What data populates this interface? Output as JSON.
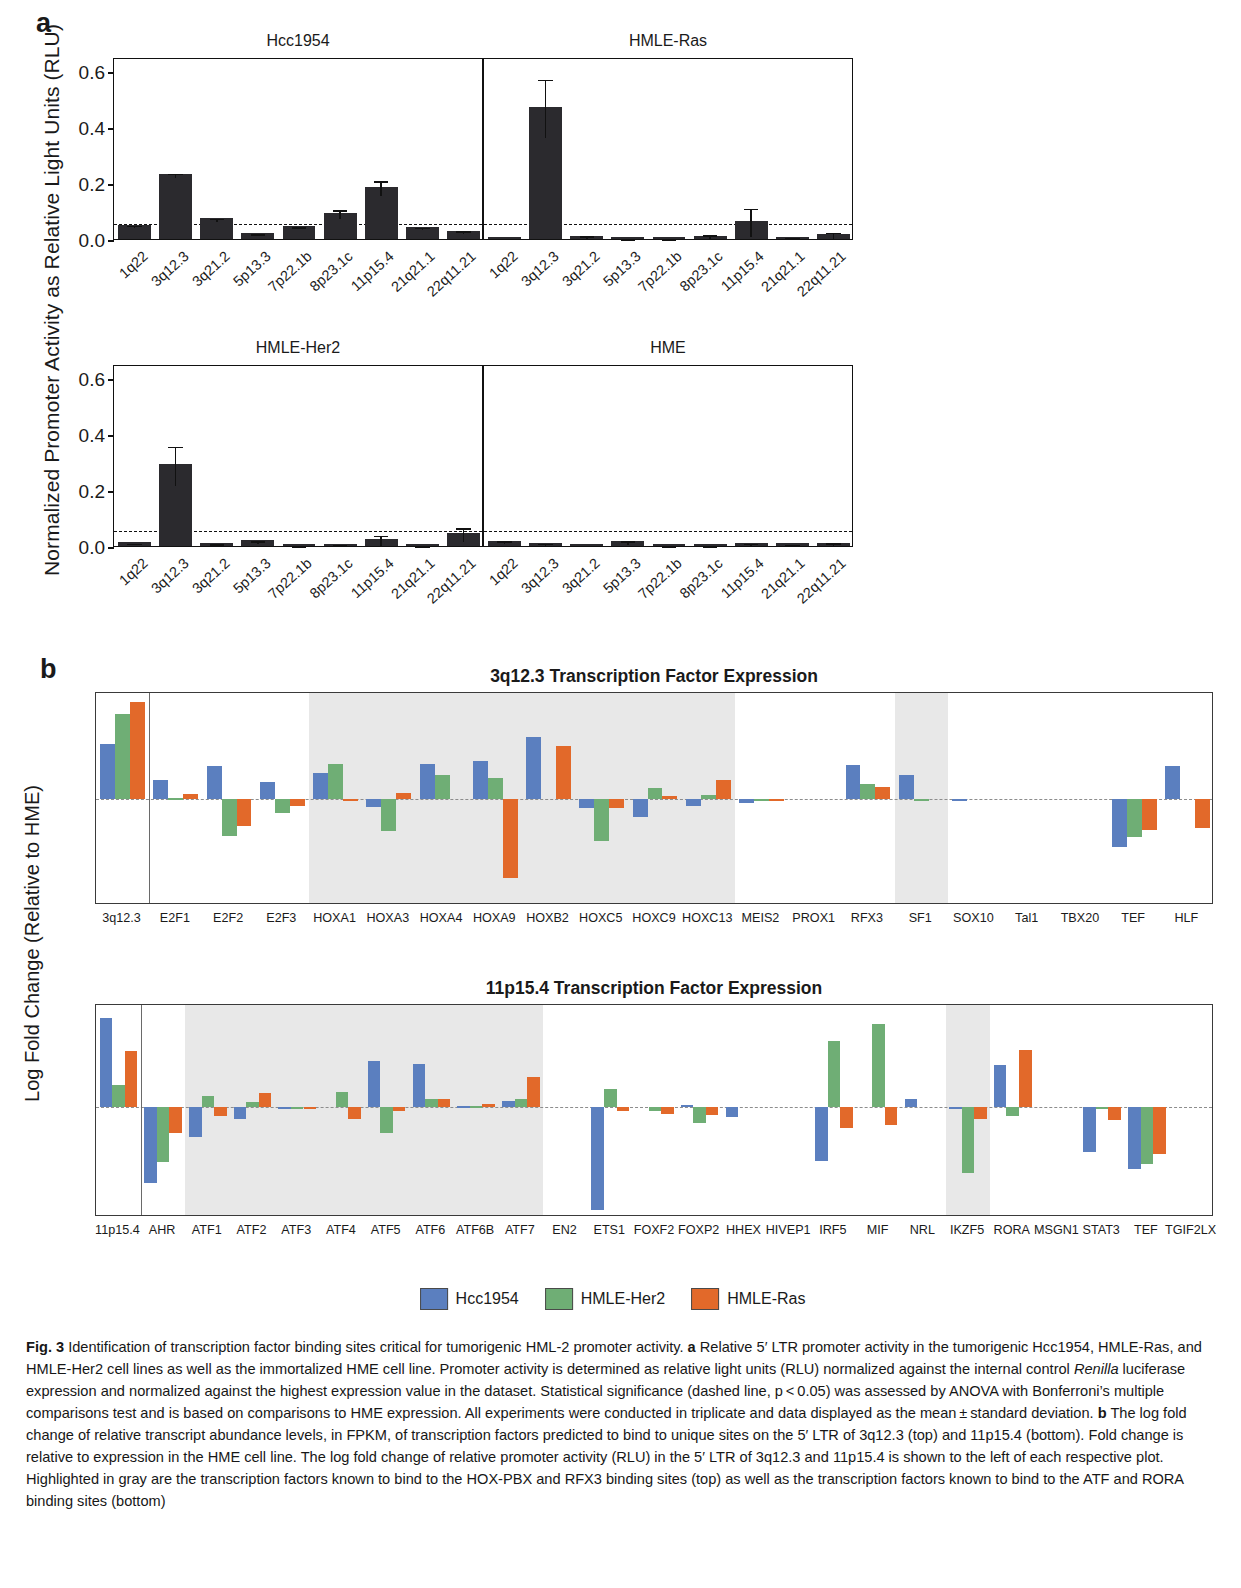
{
  "figure": {
    "panel_a_letter": "a",
    "panel_b_letter": "b"
  },
  "panel_a": {
    "ylabel": "Normalized Promoter Activity as Relative Light Units (RLU)",
    "yticks": [
      "0.0",
      "0.2",
      "0.4",
      "0.6"
    ],
    "ylim": [
      0,
      0.65
    ],
    "significance_line": 0.062,
    "categories": [
      "1q22",
      "3q12.3",
      "3q21.2",
      "5p13.3",
      "7p22.1b",
      "8p23.1c",
      "11p15.4",
      "21q21.1",
      "22q11.21"
    ],
    "charts": [
      {
        "title": "Hcc1954",
        "values": [
          0.051,
          0.232,
          0.074,
          0.022,
          0.046,
          0.093,
          0.186,
          0.043,
          0.03
        ],
        "errors": [
          0.004,
          0.008,
          0.006,
          0.003,
          0.004,
          0.016,
          0.027,
          0.004,
          0.004
        ]
      },
      {
        "title": "HMLE-Ras",
        "values": [
          0.006,
          0.472,
          0.012,
          0.005,
          0.005,
          0.011,
          0.064,
          0.008,
          0.018
        ],
        "errors": [
          0.002,
          0.104,
          0.006,
          0.002,
          0.002,
          0.009,
          0.051,
          0.004,
          0.012
        ]
      },
      {
        "title": "HMLE-Her2",
        "values": [
          0.013,
          0.292,
          0.01,
          0.02,
          0.004,
          0.006,
          0.024,
          0.004,
          0.046
        ],
        "errors": [
          0.003,
          0.07,
          0.003,
          0.005,
          0.002,
          0.003,
          0.02,
          0.002,
          0.025
        ]
      },
      {
        "title": "HME",
        "values": [
          0.019,
          0.012,
          0.006,
          0.017,
          0.003,
          0.003,
          0.011,
          0.009,
          0.012
        ],
        "errors": [
          0.005,
          0.004,
          0.002,
          0.008,
          0.001,
          0.001,
          0.004,
          0.003,
          0.005
        ]
      }
    ]
  },
  "panel_b": {
    "ylabel": "Log Fold Change (Relative to HME)",
    "legend": [
      {
        "label": "Hcc1954",
        "color": "#5b7fbf"
      },
      {
        "label": "HMLE-Her2",
        "color": "#6fae75"
      },
      {
        "label": "HMLE-Ras",
        "color": "#e2692a"
      }
    ],
    "charts": [
      {
        "title": "3q12.3 Transcription Factor Expression",
        "yticks": [
          "-1.5",
          "-1.0",
          "-0.5",
          "0.0",
          "0.5",
          "1.0",
          "1.5"
        ],
        "ylim": [
          -1.75,
          1.75
        ],
        "separator_after": 1,
        "shaded_ranges": [
          [
            4,
            11
          ],
          [
            15,
            15
          ]
        ],
        "categories": [
          "3q12.3",
          "E2F1",
          "E2F2",
          "E2F3",
          "HOXA1",
          "HOXA3",
          "HOXA4",
          "HOXA9",
          "HOXB2",
          "HOXC5",
          "HOXC9",
          "HOXC13",
          "MEIS2",
          "PROX1",
          "RFX3",
          "SF1",
          "SOX10",
          "Tal1",
          "TBX20",
          "TEF",
          "HLF"
        ],
        "series": [
          {
            "name": "Hcc1954",
            "values": [
              0.9,
              0.31,
              0.54,
              0.28,
              0.43,
              -0.13,
              0.57,
              0.62,
              1.02,
              -0.15,
              -0.3,
              -0.11,
              -0.06,
              0.0,
              0.56,
              0.39,
              -0.01,
              0.0,
              0.0,
              -0.79,
              0.54
            ]
          },
          {
            "name": "HMLE-Her2",
            "values": [
              1.4,
              0.02,
              -0.61,
              -0.23,
              0.58,
              -0.53,
              0.4,
              0.34,
              0.0,
              -0.7,
              0.18,
              0.06,
              -0.04,
              0.0,
              0.25,
              -0.01,
              0.0,
              0.0,
              0.0,
              -0.62,
              0.0
            ]
          },
          {
            "name": "HMLE-Ras",
            "values": [
              1.6,
              0.08,
              -0.45,
              -0.11,
              -0.01,
              0.1,
              0.0,
              -1.3,
              0.88,
              -0.15,
              0.05,
              0.32,
              -0.02,
              0.0,
              0.2,
              0.0,
              0.0,
              0.0,
              0.0,
              -0.51,
              -0.48
            ]
          }
        ]
      },
      {
        "title": "11p15.4 Transcription Factor Expression",
        "yticks": [
          "-1.0",
          "-0.5",
          "0.0",
          "0.5",
          "1.0"
        ],
        "ylim": [
          -1.42,
          1.32
        ],
        "separator_after": 1,
        "shaded_ranges": [
          [
            2,
            9
          ],
          [
            19,
            19
          ]
        ],
        "categories": [
          "11p15.4",
          "AHR",
          "ATF1",
          "ATF2",
          "ATF3",
          "ATF4",
          "ATF5",
          "ATF6",
          "ATF6B",
          "ATF7",
          "EN2",
          "ETS1",
          "FOXF2",
          "FOXP2",
          "HHEX",
          "HIVEP1",
          "IRF5",
          "MIF",
          "NRL",
          "IKZF5",
          "RORA",
          "MSGN1",
          "STAT3",
          "TEF",
          "TGIF2LX"
        ],
        "series": [
          {
            "name": "Hcc1954",
            "values": [
              1.15,
              -0.98,
              -0.38,
              -0.15,
              -0.03,
              0.0,
              0.6,
              0.56,
              0.02,
              0.08,
              0.0,
              -1.33,
              0.0,
              0.03,
              -0.13,
              0.0,
              -0.7,
              0.0,
              0.1,
              -0.02,
              0.54,
              0.0,
              -0.58,
              -0.8,
              0.0
            ]
          },
          {
            "name": "HMLE-Her2",
            "values": [
              0.28,
              -0.71,
              0.14,
              0.06,
              -0.01,
              0.19,
              -0.33,
              0.1,
              0.02,
              0.1,
              0.0,
              0.23,
              -0.05,
              -0.2,
              0.0,
              0.0,
              0.86,
              1.08,
              0.0,
              -0.85,
              -0.12,
              0.0,
              -0.02,
              -0.74,
              0.0
            ]
          },
          {
            "name": "HMLE-Ras",
            "values": [
              0.72,
              -0.34,
              -0.12,
              0.18,
              -0.02,
              -0.15,
              -0.05,
              0.11,
              0.04,
              0.39,
              0.0,
              -0.05,
              -0.09,
              -0.1,
              0.0,
              0.0,
              -0.27,
              -0.23,
              0.0,
              -0.15,
              0.74,
              0.0,
              -0.17,
              -0.6,
              0.0
            ]
          }
        ]
      }
    ]
  },
  "caption": {
    "figure_number": "Fig. 3",
    "text_parts": [
      {
        "t": "  Identification of transcription factor binding sites critical for tumorigenic HML-2 promoter activity. ",
        "s": "n"
      },
      {
        "t": "a",
        "s": "b"
      },
      {
        "t": " Relative 5′ LTR promoter activity in the tumorigenic Hcc1954, HMLE-Ras, and HMLE-Her2 cell lines as well as the immortalized HME cell line. Promoter activity is determined as relative light units (RLU) normalized against the internal control ",
        "s": "n"
      },
      {
        "t": "Renilla",
        "s": "i"
      },
      {
        "t": " luciferase expression and normalized against the highest expression value in the dataset. Statistical significance (dashed line, p < 0.05) was assessed by ANOVA with Bonferroni’s multiple comparisons test and is based on comparisons to HME expression. All experiments were conducted in triplicate and data displayed as the mean ± standard deviation. ",
        "s": "n"
      },
      {
        "t": "b",
        "s": "b"
      },
      {
        "t": " The log fold change of relative transcript abundance levels, in FPKM, of transcription factors predicted to bind to unique sites on the 5′ LTR of 3q12.3 (top) and 11p15.4 (bottom). Fold change is relative to expression in the HME cell line. The log fold change of relative promoter activity (RLU) in the 5′ LTR of 3q12.3 and 11p15.4 is shown to the left of each respective plot. Highlighted in gray are the transcription factors known to bind to the HOX-PBX and RFX3 binding sites (top) as well as the transcription factors known to bind to the ATF and RORA binding sites (bottom)",
        "s": "n"
      }
    ]
  }
}
